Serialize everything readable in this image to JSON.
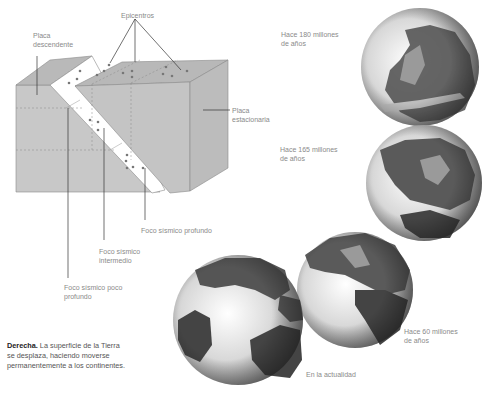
{
  "diagram": {
    "labels": {
      "epicentros": "Epicentros",
      "placa_descendente": [
        "Placa",
        "descendente"
      ],
      "placa_estacionaria": [
        "Placa",
        "estacionaria"
      ],
      "foco_profundo": "Foco sísmico profundo",
      "foco_intermedio": [
        "Foco sísmico",
        "intermedio"
      ],
      "foco_poco_profundo": [
        "Foco sísmico poco",
        "profundo"
      ]
    },
    "globes": [
      {
        "label": [
          "Hace 180 millones",
          "de años"
        ]
      },
      {
        "label": [
          "Hace 165 millones",
          "de años"
        ]
      },
      {
        "label": [
          "Hace 60 millones",
          "de años"
        ]
      },
      {
        "label": [
          "En la actualidad"
        ]
      }
    ],
    "caption": {
      "bold": "Derecha.",
      "text": " La superficie de la Tierra se desplaza, haciendo moverse permanentemente a los continentes."
    },
    "colors": {
      "block_fill": "#c9c9c9",
      "block_top": "#b5b5b5",
      "block_side": "#bdbdbd",
      "slab": "#ffffff",
      "land": "#555555",
      "ocean": "#e6e6e6"
    }
  }
}
